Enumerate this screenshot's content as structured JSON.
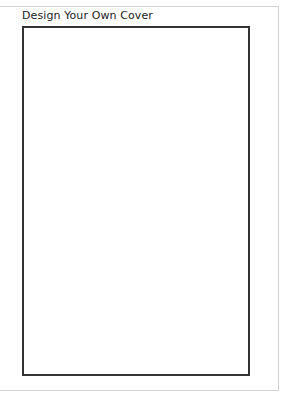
{
  "panel": {
    "title": "Design Your Own Cover"
  },
  "canvas": {
    "border_color": "#333333",
    "background": "#ffffff"
  },
  "colors": {
    "panel_border": "#d4d4d4",
    "title_text": "#222222"
  }
}
